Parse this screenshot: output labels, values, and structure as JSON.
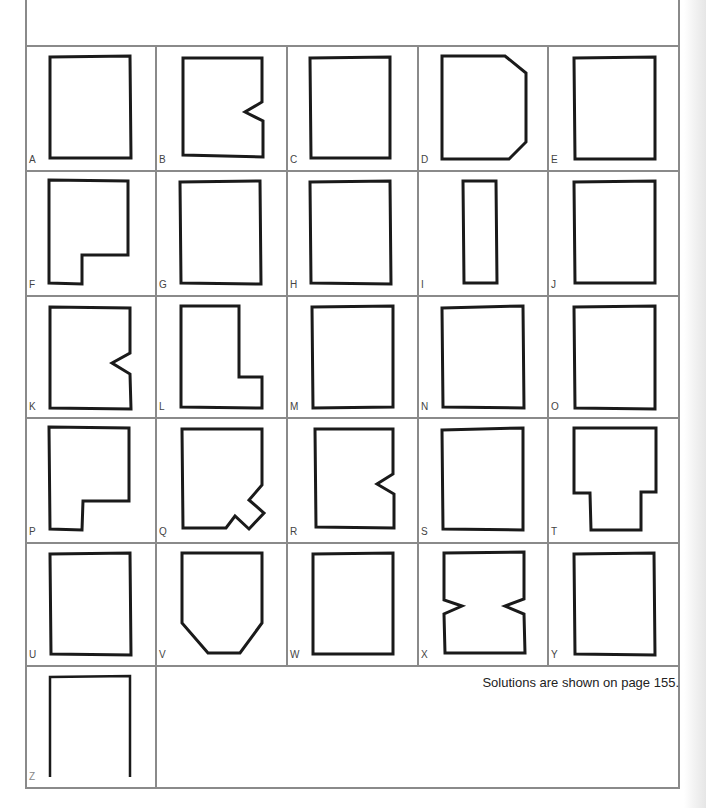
{
  "puzzle": {
    "note": "Solutions are shown on page 155.",
    "colors": {
      "grid_line": "#8a8a8a",
      "shape_stroke": "#1a1a1a",
      "label": "#444444"
    },
    "cells": [
      {
        "label": "A",
        "shape": "rectangle"
      },
      {
        "label": "B",
        "shape": "rectangle-right-notch"
      },
      {
        "label": "C",
        "shape": "rectangle"
      },
      {
        "label": "D",
        "shape": "rectangle-right-chamfered"
      },
      {
        "label": "E",
        "shape": "rectangle"
      },
      {
        "label": "F",
        "shape": "rectangle-bottom-right-cutout"
      },
      {
        "label": "G",
        "shape": "rectangle"
      },
      {
        "label": "H",
        "shape": "rectangle"
      },
      {
        "label": "I",
        "shape": "narrow-rectangle"
      },
      {
        "label": "J",
        "shape": "rectangle"
      },
      {
        "label": "K",
        "shape": "rectangle-right-notch"
      },
      {
        "label": "L",
        "shape": "l-shape"
      },
      {
        "label": "M",
        "shape": "rectangle"
      },
      {
        "label": "N",
        "shape": "rectangle"
      },
      {
        "label": "O",
        "shape": "rectangle"
      },
      {
        "label": "P",
        "shape": "rectangle-bottom-right-cutout"
      },
      {
        "label": "Q",
        "shape": "rectangle-bottom-right-jagged"
      },
      {
        "label": "R",
        "shape": "rectangle-right-notch"
      },
      {
        "label": "S",
        "shape": "rectangle"
      },
      {
        "label": "T",
        "shape": "t-shape"
      },
      {
        "label": "U",
        "shape": "rectangle"
      },
      {
        "label": "V",
        "shape": "shield"
      },
      {
        "label": "W",
        "shape": "rectangle"
      },
      {
        "label": "X",
        "shape": "rectangle-double-notch"
      },
      {
        "label": "Y",
        "shape": "rectangle"
      },
      {
        "label": "Z",
        "shape": "rectangle"
      }
    ]
  }
}
